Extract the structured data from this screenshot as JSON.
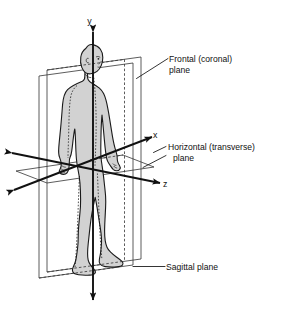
{
  "diagram": {
    "background_color": "#ffffff",
    "ink_color": "#111111",
    "body_fill_color": "#d2d2d2",
    "body_outline_color": "#1a1a1a",
    "plane_line_color": "#333333"
  },
  "axes": [
    {
      "id": "y",
      "label": "y",
      "direction": "vertical",
      "arrowheads": "both"
    },
    {
      "id": "x",
      "label": "x",
      "direction": "diagonal-up-right",
      "arrowheads": "both"
    },
    {
      "id": "z",
      "label": "z",
      "direction": "diagonal-down-right",
      "arrowheads": "both"
    }
  ],
  "labels": {
    "frontal": {
      "line1": "Frontal (coronal)",
      "line2": "plane"
    },
    "horizontal": {
      "line1": "Horizontal (transverse)",
      "line2": "plane"
    },
    "sagittal": {
      "line1": "Sagittal plane"
    }
  },
  "planes": [
    {
      "id": "sagittal",
      "name": "Sagittal plane",
      "orientation": "vertical-left-right-divide"
    },
    {
      "id": "frontal",
      "name": "Frontal (coronal) plane",
      "orientation": "vertical-front-back-divide"
    },
    {
      "id": "horizontal",
      "name": "Horizontal (transverse) plane",
      "orientation": "horizontal-upper-lower-divide"
    }
  ]
}
